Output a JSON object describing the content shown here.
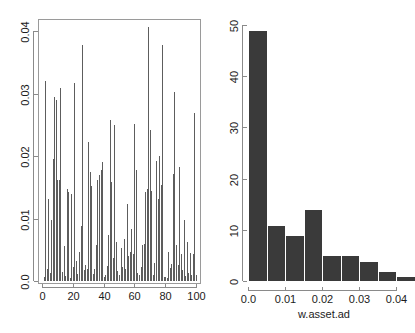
{
  "figure": {
    "panels": [
      "left-spike-plot",
      "right-histogram"
    ],
    "background_color": "#ffffff",
    "spike_color": "#5d5d5d",
    "bar_color": "#3a3a3a",
    "axis_color": "#8a8a8a"
  },
  "chart_data": [
    {
      "type": "bar",
      "name": "w.asset.ad index plot",
      "title": "",
      "xlabel": "",
      "ylabel": "",
      "xlim": [
        0,
        100
      ],
      "ylim": [
        0,
        0.0425
      ],
      "grid": false,
      "legend": false,
      "xticks": [
        0,
        20,
        40,
        60,
        80,
        100
      ],
      "xticklabels": [
        "0",
        "20",
        "40",
        "60",
        "80",
        "100"
      ],
      "yticks": [
        0.0,
        0.01,
        0.02,
        0.03,
        0.04
      ],
      "yticklabels": [
        "0.0",
        "0.01",
        "0.02",
        "0.03",
        "0.04"
      ],
      "categories": [
        1,
        2,
        3,
        4,
        5,
        6,
        7,
        8,
        9,
        10,
        11,
        12,
        13,
        14,
        15,
        16,
        17,
        18,
        19,
        20,
        21,
        22,
        23,
        24,
        25,
        26,
        27,
        28,
        29,
        30,
        31,
        32,
        33,
        34,
        35,
        36,
        37,
        38,
        39,
        40,
        41,
        42,
        43,
        44,
        45,
        46,
        47,
        48,
        49,
        50,
        51,
        52,
        53,
        54,
        55,
        56,
        57,
        58,
        59,
        60,
        61,
        62,
        63,
        64,
        65,
        66,
        67,
        68,
        69,
        70,
        71,
        72,
        73,
        74,
        75,
        76,
        77,
        78,
        79,
        80,
        81,
        82,
        83,
        84,
        85,
        86,
        87,
        88,
        89,
        90,
        91,
        92,
        93,
        94,
        95,
        96,
        97,
        98,
        99,
        100
      ],
      "values": [
        0.0006,
        0.032,
        0.002,
        0.0132,
        0.0013,
        0.0098,
        0.0196,
        0.0294,
        0.029,
        0.0161,
        0.0162,
        0.0309,
        0.0014,
        0.0056,
        0.0008,
        0.0148,
        0.0143,
        0.0005,
        0.014,
        0.0023,
        0.0317,
        0.0032,
        0.0012,
        0.0047,
        0.0088,
        0.0378,
        0.0018,
        0.0026,
        0.002,
        0.0222,
        0.0175,
        0.0152,
        0.0011,
        0.0019,
        0.0058,
        0.0162,
        0.017,
        0.0177,
        0.0191,
        0.0006,
        0.0009,
        0.0024,
        0.0074,
        0.0258,
        0.0159,
        0.0037,
        0.0249,
        0.0062,
        0.0016,
        0.001,
        0.0053,
        0.0022,
        0.0068,
        0.0019,
        0.0124,
        0.004,
        0.0046,
        0.0083,
        0.0044,
        0.0252,
        0.0178,
        0.0013,
        0.0009,
        0.0023,
        0.0058,
        0.006,
        0.0142,
        0.0148,
        0.0407,
        0.0241,
        0.0144,
        0.0009,
        0.0029,
        0.0192,
        0.0132,
        0.02,
        0.0153,
        0.0378,
        0.0007,
        0.0006,
        0.0005,
        0.0046,
        0.0021,
        0.0027,
        0.0172,
        0.0302,
        0.0058,
        0.0025,
        0.0182,
        0.0043,
        0.0017,
        0.0098,
        0.0008,
        0.0062,
        0.0013,
        0.0045,
        0.0009,
        0.0043,
        0.0269,
        0.001
      ]
    },
    {
      "type": "bar",
      "name": "w.asset.ad histogram",
      "title": "",
      "xlabel": "w.asset.ad",
      "ylabel": "",
      "xlim": [
        0.0,
        0.045
      ],
      "ylim": [
        0,
        50
      ],
      "grid": false,
      "legend": false,
      "xticks": [
        0.0,
        0.01,
        0.02,
        0.03,
        0.04
      ],
      "xticklabels": [
        "0.0",
        "0.01",
        "0.02",
        "0.03",
        "0.04"
      ],
      "yticks": [
        0,
        10,
        20,
        30,
        40,
        50
      ],
      "yticklabels": [
        "0",
        "10",
        "20",
        "30",
        "40",
        "50"
      ],
      "bin_edges": [
        0.0,
        0.005,
        0.01,
        0.015,
        0.02,
        0.025,
        0.03,
        0.035,
        0.04,
        0.045
      ],
      "categories": [
        "0.000-0.005",
        "0.005-0.010",
        "0.010-0.015",
        "0.015-0.020",
        "0.020-0.025",
        "0.025-0.030",
        "0.030-0.035",
        "0.035-0.040",
        "0.040-0.045"
      ],
      "values": [
        49,
        11,
        9,
        14,
        5,
        5,
        4,
        2,
        1
      ]
    }
  ]
}
